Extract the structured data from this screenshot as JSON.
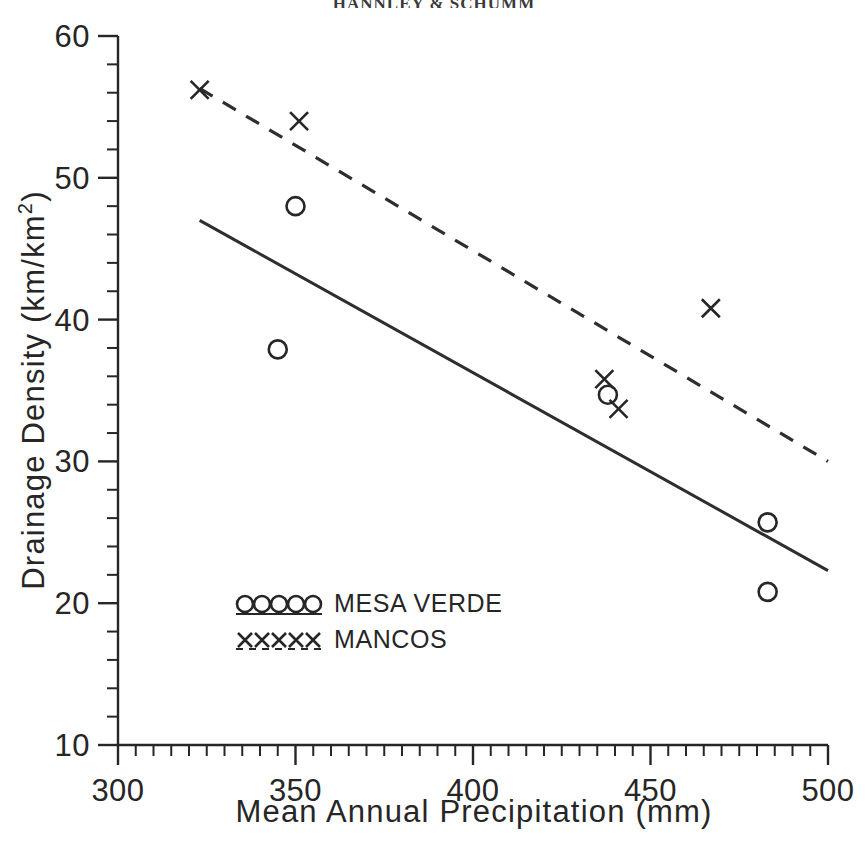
{
  "chart_data": {
    "type": "scatter",
    "title": "HANNLEY & SCHUMM",
    "xlabel": "Mean Annual Precipitation (mm)",
    "ylabel_main": "Drainage Density  (km/km",
    "ylabel_exponent": "2",
    "ylabel_close": ")",
    "ylabel": "Drainage Density (km/km^2)",
    "xlim": [
      300,
      500
    ],
    "ylim": [
      10,
      60
    ],
    "x_ticks": [
      300,
      350,
      400,
      450,
      500
    ],
    "x_tick_labels": [
      "300",
      "350",
      "400",
      "450",
      "500"
    ],
    "x_minor_step": 5,
    "y_ticks": [
      10,
      20,
      30,
      40,
      50,
      60
    ],
    "y_tick_labels": [
      "10",
      "20",
      "30",
      "40",
      "50",
      "60"
    ],
    "y_minor_step": 2,
    "grid": false,
    "legend_position": "inside-lower-left",
    "series": [
      {
        "name": "MESA VERDE",
        "marker": "circle",
        "linestyle": "solid",
        "points": [
          {
            "x": 345,
            "y": 37.9
          },
          {
            "x": 350,
            "y": 48.0
          },
          {
            "x": 438,
            "y": 34.7
          },
          {
            "x": 483,
            "y": 25.7
          },
          {
            "x": 483,
            "y": 20.8
          }
        ],
        "fit_line": {
          "x1": 323,
          "y1": 47.0,
          "x2": 500,
          "y2": 22.3
        }
      },
      {
        "name": "MANCOS",
        "marker": "x",
        "linestyle": "dashed",
        "points": [
          {
            "x": 323,
            "y": 56.2
          },
          {
            "x": 351,
            "y": 54.0
          },
          {
            "x": 437,
            "y": 35.8
          },
          {
            "x": 441,
            "y": 33.7
          },
          {
            "x": 467,
            "y": 40.8
          }
        ],
        "fit_line": {
          "x1": 323,
          "y1": 56.3,
          "x2": 500,
          "y2": 30.0
        }
      }
    ]
  },
  "legend": {
    "entries": [
      {
        "label": "MESA VERDE",
        "marker": "circle"
      },
      {
        "label": "MANCOS",
        "marker": "x"
      }
    ]
  }
}
